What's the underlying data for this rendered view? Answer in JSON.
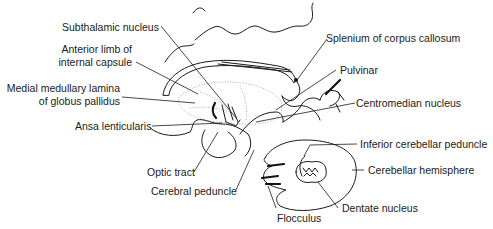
{
  "diagram": {
    "type": "anatomical line drawing",
    "labels": {
      "subthalamic_nucleus": "Subthalamic nucleus",
      "anterior_limb_1": "Anterior limb of",
      "anterior_limb_2": "internal capsule",
      "medial_medullary_1": "Medial medullary lamina",
      "medial_medullary_2": "of globus pallidus",
      "ansa_lenticularis": "Ansa lenticularis",
      "optic_tract": "Optic tract",
      "cerebral_peduncle": "Cerebral peduncle",
      "splenium": "Splenium of corpus callosum",
      "pulvinar": "Pulvinar",
      "centromedian_nucleus": "Centromedian nucleus",
      "inferior_cerebellar_peduncle": "Inferior cerebellar peduncle",
      "cerebellar_hemisphere": "Cerebellar hemisphere",
      "dentate_nucleus": "Dentate nucleus",
      "flocculus": "Flocculus"
    },
    "colors": {
      "line": "#1a1a1a",
      "background": "#ffffff",
      "dotted": "#888888"
    }
  }
}
